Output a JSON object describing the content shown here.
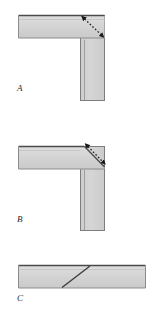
{
  "figure": {
    "title": "",
    "background_color": "#ffffff",
    "beam_fill": "#d2d2d2",
    "beam_fill_light": "#dcdcdc",
    "beam_fill_shade": "#c6c6c6",
    "edge_dark": "#4a4a4a",
    "edge_mid": "#8c8c8c",
    "edge_light": "#b4b4b4",
    "arrow_color": "#1a1a1a",
    "joint_line_color": "#3a3a3a"
  },
  "panels": [
    {
      "id": "a",
      "label": "A",
      "joint_type": "square-butt-corner",
      "description": "L-corner joint with square butt end and dashed double-headed diagonal arrow across the corner",
      "has_dashed_arrow": true
    },
    {
      "id": "b",
      "label": "B",
      "joint_type": "mitered-corner",
      "description": "L-corner joint with 45 degree mitered end and dashed double-headed arrow parallel to the miter",
      "has_dashed_arrow": true
    },
    {
      "id": "c",
      "label": "C",
      "joint_type": "scarf-splice",
      "description": "Straight horizontal member with a single diagonal scarf joint line",
      "has_dashed_arrow": false
    }
  ]
}
